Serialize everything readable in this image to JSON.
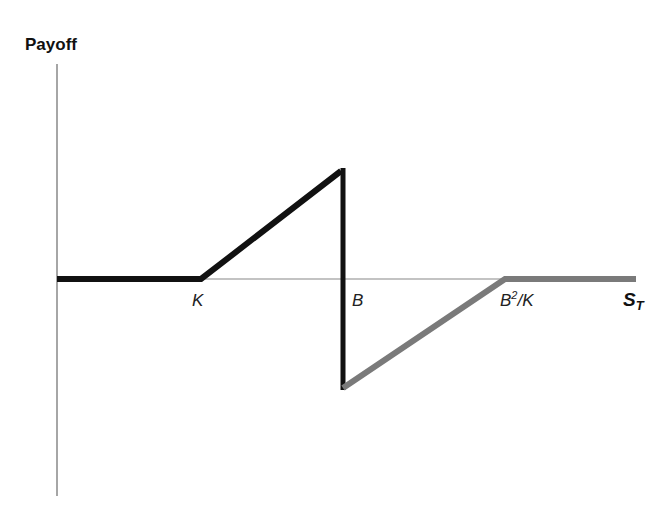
{
  "diagram": {
    "title": "",
    "y_axis_label": "Payoff",
    "x_axis_label": {
      "main": "S",
      "sub": "T"
    },
    "tick_labels": [
      {
        "id": "K",
        "text": "K"
      },
      {
        "id": "B",
        "text": "B"
      },
      {
        "id": "B2K",
        "base": "B",
        "sup": "2",
        "rest": "/K"
      }
    ],
    "colors": {
      "axis": "#888888",
      "payoff_positive": "#111111",
      "payoff_negative": "#7a7a7a",
      "text": "#111111"
    },
    "payoff_segments": [
      {
        "name": "flat-left",
        "from": "0",
        "to": "K",
        "value": "0",
        "color_key": "payoff_positive"
      },
      {
        "name": "rising",
        "from": "K",
        "to": "B",
        "value": "S_T - K",
        "color_key": "payoff_positive"
      },
      {
        "name": "drop-at-barrier",
        "at": "B",
        "color_key": "payoff_positive"
      },
      {
        "name": "rising-negative",
        "from": "B",
        "to": "B^2/K",
        "value": "-(B^2/K - S_T)·(K/B)",
        "color_key": "payoff_negative"
      },
      {
        "name": "flat-right",
        "from": "B^2/K",
        "to": "inf",
        "value": "0",
        "color_key": "payoff_negative"
      }
    ]
  }
}
